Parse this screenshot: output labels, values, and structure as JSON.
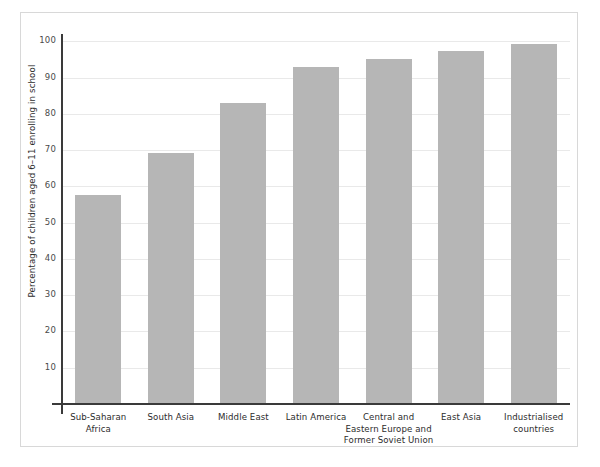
{
  "chart_data": {
    "type": "bar",
    "title": "",
    "xlabel": "",
    "ylabel": "Percentage of children aged 6–11 enrolling in school",
    "categories": [
      "Sub-Saharan Africa",
      "South Asia",
      "Middle East",
      "Latin America",
      "Central and Eastern Europe and Former Soviet Union",
      "East Asia",
      "Industrialised countries"
    ],
    "category_lines": [
      [
        "Sub-Saharan",
        "Africa"
      ],
      [
        "South Asia"
      ],
      [
        "Middle East"
      ],
      [
        "Latin America"
      ],
      [
        "Central and",
        "Eastern Europe and",
        "Former Soviet Union"
      ],
      [
        "East Asia"
      ],
      [
        "Industrialised",
        "countries"
      ]
    ],
    "values": [
      57.5,
      69.3,
      83.0,
      93.0,
      95.0,
      97.2,
      99.2
    ],
    "ylim": [
      0,
      102
    ],
    "yticks": [
      10,
      20,
      30,
      40,
      50,
      60,
      70,
      80,
      90,
      100
    ],
    "ytick_labels": [
      "10",
      "20",
      "30",
      "40",
      "50",
      "60",
      "70",
      "80",
      "90",
      "100"
    ],
    "grid": true,
    "legend": false,
    "bar_color": "#b6b6b6",
    "gridline_color": "#e9e9e9",
    "axis_color": "#3a3a3a",
    "background_color": "#ffffff",
    "frame_color": "#d8d8d8"
  }
}
